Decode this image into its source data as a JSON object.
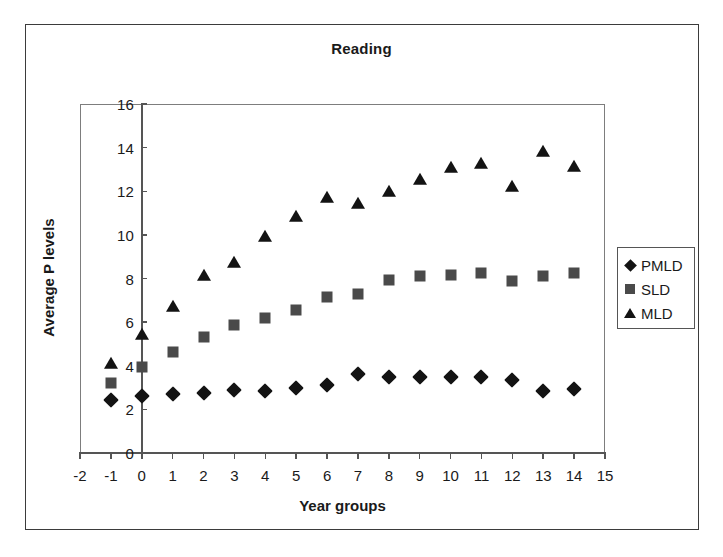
{
  "chart_data": {
    "type": "scatter",
    "title": "Reading",
    "xlabel": "Year groups",
    "ylabel": "Average P levels",
    "xlim": [
      -2,
      15
    ],
    "ylim": [
      0,
      16
    ],
    "xticks": [
      -2,
      -1,
      0,
      1,
      2,
      3,
      4,
      5,
      6,
      7,
      8,
      9,
      10,
      11,
      12,
      13,
      14,
      15
    ],
    "yticks": [
      0,
      2,
      4,
      6,
      8,
      10,
      12,
      14,
      16
    ],
    "xtick_labels": [
      "-2",
      "-1",
      "0",
      "1",
      "2",
      "3",
      "4",
      "5",
      "6",
      "7",
      "8",
      "9",
      "10",
      "11",
      "12",
      "13",
      "14",
      "15"
    ],
    "ytick_labels": [
      "0",
      "2",
      "4",
      "6",
      "8",
      "10",
      "12",
      "14",
      "16"
    ],
    "grid": false,
    "legend_position": "right-outside",
    "x": [
      -1,
      0,
      1,
      2,
      3,
      4,
      5,
      6,
      7,
      8,
      9,
      10,
      11,
      12,
      13,
      14
    ],
    "series": [
      {
        "name": "PMLD",
        "marker": "diamond",
        "color": "#131313",
        "values": [
          2.45,
          2.6,
          2.7,
          2.75,
          2.9,
          2.85,
          3.0,
          3.1,
          3.6,
          3.5,
          3.5,
          3.5,
          3.5,
          3.35,
          2.85,
          2.95
        ]
      },
      {
        "name": "SLD",
        "marker": "square",
        "color": "#4a4a4a",
        "values": [
          3.2,
          3.95,
          4.65,
          5.3,
          5.85,
          6.2,
          6.55,
          7.15,
          7.3,
          7.95,
          8.1,
          8.15,
          8.25,
          7.9,
          8.1,
          8.25
        ]
      },
      {
        "name": "MLD",
        "marker": "triangle",
        "color": "#131313",
        "values": [
          4.1,
          5.4,
          6.7,
          8.1,
          8.7,
          9.9,
          10.8,
          11.7,
          11.4,
          11.95,
          12.5,
          13.05,
          13.25,
          12.2,
          13.8,
          13.1
        ]
      }
    ]
  },
  "legend": {
    "items": [
      {
        "label": "PMLD",
        "marker": "diamond"
      },
      {
        "label": "SLD",
        "marker": "square"
      },
      {
        "label": "MLD",
        "marker": "triangle"
      }
    ]
  }
}
